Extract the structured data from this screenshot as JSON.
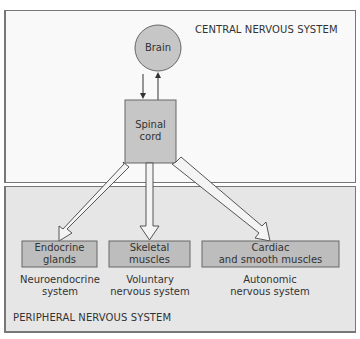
{
  "regions": {
    "central": {
      "label": "CENTRAL NERVOUS SYSTEM",
      "fill": "#f9f9f9"
    },
    "peripheral": {
      "label": "PERIPHERAL NERVOUS SYSTEM",
      "fill": "#e6e6e6"
    }
  },
  "nodes": {
    "brain": {
      "label": "Brain",
      "shape": "circle",
      "fill": "#c6c6c6"
    },
    "spinal_cord": {
      "label_line1": "Spinal",
      "label_line2": "cord",
      "shape": "rectangle",
      "fill": "#c6c6c6"
    },
    "endocrine": {
      "label_line1": "Endocrine",
      "label_line2": "glands",
      "fill": "#bdbdbd",
      "caption_line1": "Neuroendocrine",
      "caption_line2": "system"
    },
    "skeletal": {
      "label_line1": "Skeletal",
      "label_line2": "muscles",
      "fill": "#bdbdbd",
      "caption_line1": "Voluntary",
      "caption_line2": "nervous system"
    },
    "cardiac": {
      "label_line1": "Cardiac",
      "label_line2": "and smooth muscles",
      "fill": "#bdbdbd",
      "caption_line1": "Autonomic",
      "caption_line2": "nervous system"
    }
  },
  "edges": [
    {
      "from": "brain",
      "to": "spinal_cord",
      "style": "thin-arrow"
    },
    {
      "from": "spinal_cord",
      "to": "brain",
      "style": "thin-arrow"
    },
    {
      "from": "spinal_cord",
      "to": "endocrine",
      "style": "hollow-arrow"
    },
    {
      "from": "spinal_cord",
      "to": "skeletal",
      "style": "hollow-arrow"
    },
    {
      "from": "spinal_cord",
      "to": "cardiac",
      "style": "hollow-arrow"
    }
  ]
}
